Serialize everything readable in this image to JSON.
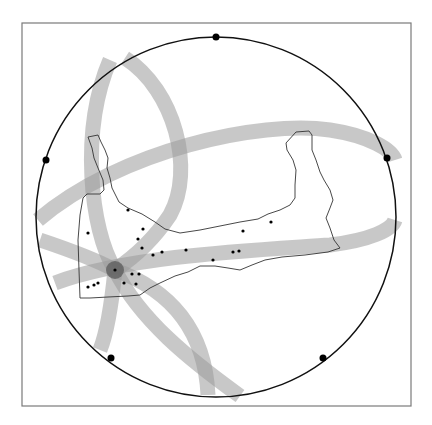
{
  "figure": {
    "type": "localization-diagram",
    "frame": {
      "x": 22,
      "y": 23,
      "width": 389,
      "height": 383,
      "stroke": "#7a7a7a"
    },
    "horizon_circle": {
      "cx": 216,
      "cy": 217,
      "r": 180,
      "stroke": "#111111"
    },
    "station_markers": [
      {
        "x": 216,
        "y": 37
      },
      {
        "x": 46,
        "y": 160
      },
      {
        "x": 387,
        "y": 158
      },
      {
        "x": 111,
        "y": 358
      },
      {
        "x": 323,
        "y": 358
      }
    ],
    "band_color": "#9a9a9a",
    "band_opacity": 0.55,
    "bands": [
      {
        "id": "band-1",
        "d": "M 38 220 C 120 150, 260 120, 330 130 C 370 136, 392 150, 395 160"
      },
      {
        "id": "band-2",
        "d": "M 55 283 C 130 255, 260 250, 330 245 C 370 240, 392 230, 395 220"
      },
      {
        "id": "band-3",
        "d": "M 110 60 C 80 130, 90 230, 115 270 C 112 300, 108 330, 100 350"
      },
      {
        "id": "band-4",
        "d": "M 125 58 C 175 90, 195 170, 170 215 C 150 245, 130 260, 115 270"
      },
      {
        "id": "band-5",
        "d": "M 40 240 C 70 250, 100 262, 115 270 C 170 290, 205 330, 208 395"
      },
      {
        "id": "band-6",
        "d": "M 115 270 C 140 320, 190 360, 240 396"
      }
    ],
    "epicenter": {
      "x": 115,
      "y": 270,
      "r": 9,
      "color": "#555555"
    },
    "region_outline": {
      "stroke": "#333333",
      "d": "M 88 137 L 98 135 L 101 142 L 105 150 L 108 158 L 107 168 L 110 178 L 112 188 L 116 196 L 119 202 L 128 208 L 142 214 L 155 222 L 165 229 L 180 233 L 200 230 L 220 226 L 240 222 L 258 219 L 268 214 L 280 210 L 290 205 L 295 198 L 295 185 L 296 170 L 293 160 L 287 150 L 286 143 L 296 132 L 309 131 L 312 135 L 312 150 L 316 160 L 320 172 L 324 180 L 330 190 L 333 200 L 330 208 L 326 218 L 330 228 L 334 240 L 340 248 L 328 252 L 305 255 L 282 257 L 265 260 L 252 265 L 240 270 L 228 268 L 215 266 L 200 266 L 188 272 L 175 276 L 160 283 L 150 288 L 140 295 L 128 296 L 108 297 L 90 298 L 80 298 L 79 270 L 78 240 L 80 215 L 83 198 L 87 194 L 100 194 L 104 190 L 103 180 L 98 168 L 94 158 L 92 148 L 88 137 Z"
    },
    "event_points": [
      {
        "x": 128,
        "y": 210
      },
      {
        "x": 88,
        "y": 233
      },
      {
        "x": 143,
        "y": 229
      },
      {
        "x": 138,
        "y": 239
      },
      {
        "x": 142,
        "y": 248
      },
      {
        "x": 153,
        "y": 255
      },
      {
        "x": 162,
        "y": 252
      },
      {
        "x": 186,
        "y": 250
      },
      {
        "x": 243,
        "y": 231
      },
      {
        "x": 271,
        "y": 222
      },
      {
        "x": 213,
        "y": 260
      },
      {
        "x": 233,
        "y": 252
      },
      {
        "x": 239,
        "y": 251
      },
      {
        "x": 115,
        "y": 270
      },
      {
        "x": 132,
        "y": 274
      },
      {
        "x": 139,
        "y": 274
      },
      {
        "x": 124,
        "y": 283
      },
      {
        "x": 136,
        "y": 284
      },
      {
        "x": 88,
        "y": 287
      },
      {
        "x": 94,
        "y": 285
      },
      {
        "x": 98,
        "y": 283
      }
    ]
  }
}
